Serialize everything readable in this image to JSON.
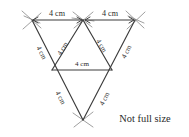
{
  "figure": {
    "caption": "Not full size",
    "unit_label": "4 cm",
    "stroke_color": "#3c3c3c",
    "arc_color": "#8e8e8e",
    "background_color": "#ffffff"
  },
  "dimensions": [
    {
      "id": "top-left-span",
      "label": "4 cm"
    },
    {
      "id": "top-right-span",
      "label": "4 cm"
    }
  ],
  "edges": [
    {
      "id": "top-left-segment",
      "label": "4 cm"
    },
    {
      "id": "top-right-segment",
      "label": "4 cm"
    },
    {
      "id": "outer-left-side",
      "label": "4 cm"
    },
    {
      "id": "inner-left-side",
      "label": "4 cm"
    },
    {
      "id": "inner-right-side",
      "label": "4 cm"
    },
    {
      "id": "outer-right-side",
      "label": "4 cm"
    },
    {
      "id": "middle-horizontal",
      "label": "4 cm"
    },
    {
      "id": "bottom-left-side",
      "label": "4 cm"
    },
    {
      "id": "bottom-right-side",
      "label": "4 cm"
    }
  ],
  "vertices": [
    {
      "id": "top-left-vertex",
      "x": 32,
      "y": 20,
      "has_arc_mark": true
    },
    {
      "id": "top-apex-vertex",
      "x": 83,
      "y": 20,
      "has_arc_mark": true
    },
    {
      "id": "top-right-vertex",
      "x": 135,
      "y": 20,
      "has_arc_mark": true
    },
    {
      "id": "mid-left-vertex",
      "x": 52,
      "y": 70,
      "has_arc_mark": false
    },
    {
      "id": "mid-right-vertex",
      "x": 112,
      "y": 70,
      "has_arc_mark": false
    },
    {
      "id": "bottom-vertex",
      "x": 83,
      "y": 120,
      "has_arc_mark": true
    }
  ]
}
